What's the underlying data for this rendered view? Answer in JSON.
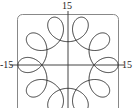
{
  "chart_data": {
    "type": "line",
    "title": "",
    "xlabel": "",
    "ylabel": "",
    "curve": "parametric loop curve",
    "parametric": {
      "a": 11,
      "b": 4,
      "k": -9,
      "t_range": [
        0,
        6.283185
      ]
    },
    "xlim": [
      -15,
      15
    ],
    "ylim": [
      -15,
      15
    ],
    "tick_labels": {
      "top": "15",
      "left": "-15",
      "right": "15"
    },
    "grid": false,
    "legend": null,
    "loops": 10,
    "line_color": "#333333",
    "frame_color": "#888888"
  }
}
